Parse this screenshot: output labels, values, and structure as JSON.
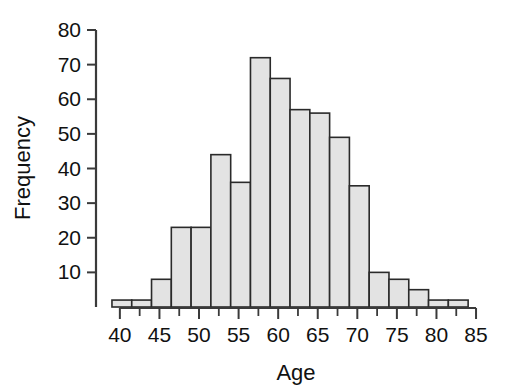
{
  "chart_data": {
    "type": "bar",
    "title": "",
    "subtitle": "",
    "xlabel": "Age",
    "ylabel": "Frequency",
    "xlim": [
      38.5,
      85.5
    ],
    "ylim": [
      0,
      80
    ],
    "bin_width": 2.5,
    "grid": false,
    "legend": null,
    "bar_fill_color": "#e3e3e3",
    "bar_edge_color": "#2a2a2a",
    "axis_color": "#3a3a3a",
    "background_color": "#ffffff",
    "x_ticks_major": [
      40,
      45,
      50,
      55,
      60,
      65,
      70,
      75,
      80,
      85
    ],
    "x_tick_labels": [
      "40",
      "45",
      "50",
      "55",
      "60",
      "65",
      "70",
      "75",
      "80",
      "85"
    ],
    "x_ticks_minor": [
      42.5,
      47.5,
      52.5,
      57.5,
      62.5,
      67.5,
      72.5,
      77.5,
      82.5
    ],
    "y_ticks": [
      10,
      20,
      30,
      40,
      50,
      60,
      70,
      80
    ],
    "y_tick_labels": [
      "10",
      "20",
      "30",
      "40",
      "50",
      "60",
      "70",
      "80"
    ],
    "categories": [
      "39.0-41.5",
      "41.5-44.0",
      "44.0-46.5",
      "46.5-49.0",
      "49.0-51.5",
      "51.5-54.0",
      "54.0-56.5",
      "56.5-59.0",
      "59.0-61.5",
      "61.5-64.0",
      "64.0-66.5",
      "66.5-69.0",
      "69.0-71.5",
      "71.5-74.0",
      "74.0-76.5",
      "76.5-79.0",
      "79.0-81.5",
      "81.5-84.0"
    ],
    "bins": [
      {
        "x0": 39.0,
        "x1": 41.5,
        "value": 2
      },
      {
        "x0": 41.5,
        "x1": 44.0,
        "value": 2
      },
      {
        "x0": 44.0,
        "x1": 46.5,
        "value": 8
      },
      {
        "x0": 46.5,
        "x1": 49.0,
        "value": 23
      },
      {
        "x0": 49.0,
        "x1": 51.5,
        "value": 23
      },
      {
        "x0": 51.5,
        "x1": 54.0,
        "value": 44
      },
      {
        "x0": 54.0,
        "x1": 56.5,
        "value": 36
      },
      {
        "x0": 56.5,
        "x1": 59.0,
        "value": 72
      },
      {
        "x0": 59.0,
        "x1": 61.5,
        "value": 66
      },
      {
        "x0": 61.5,
        "x1": 64.0,
        "value": 57
      },
      {
        "x0": 64.0,
        "x1": 66.5,
        "value": 56
      },
      {
        "x0": 66.5,
        "x1": 69.0,
        "value": 49
      },
      {
        "x0": 69.0,
        "x1": 71.5,
        "value": 35
      },
      {
        "x0": 71.5,
        "x1": 74.0,
        "value": 10
      },
      {
        "x0": 74.0,
        "x1": 76.5,
        "value": 8
      },
      {
        "x0": 76.5,
        "x1": 79.0,
        "value": 5
      },
      {
        "x0": 79.0,
        "x1": 81.5,
        "value": 2
      },
      {
        "x0": 81.5,
        "x1": 84.0,
        "value": 2
      }
    ],
    "values": [
      2,
      2,
      8,
      23,
      23,
      44,
      36,
      72,
      66,
      57,
      56,
      49,
      35,
      10,
      8,
      5,
      2,
      2
    ]
  }
}
